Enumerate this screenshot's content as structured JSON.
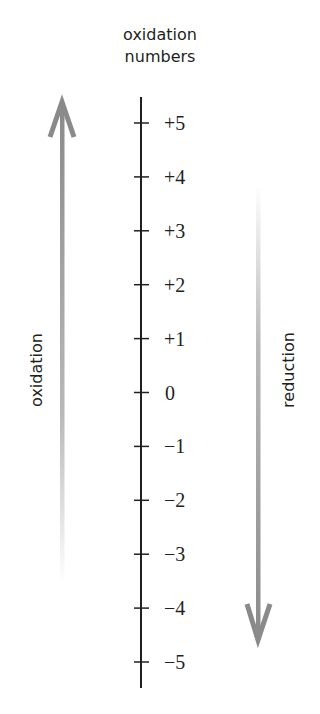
{
  "title": {
    "line1": "oxidation",
    "line2": "numbers"
  },
  "axis": {
    "ticks": [
      "+5",
      "+4",
      "+3",
      "+2",
      "+1",
      "0",
      "−1",
      "−2",
      "−3",
      "−4",
      "−5"
    ]
  },
  "left_arrow": {
    "label": "oxidation",
    "direction": "up",
    "color": "#8a8a8a"
  },
  "right_arrow": {
    "label": "reduction",
    "direction": "down",
    "color": "#8a8a8a"
  }
}
